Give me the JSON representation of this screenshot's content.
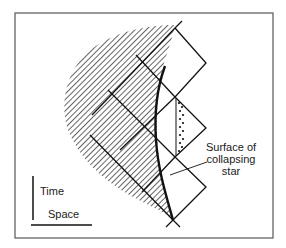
{
  "figure": {
    "frame": {
      "x": 15,
      "y": 13,
      "width": 258,
      "height": 225,
      "stroke": "#555555"
    },
    "colors": {
      "ink": "#111111",
      "hatch": "#222222",
      "background": "#ffffff"
    },
    "labels": {
      "surface": [
        "Surface of",
        "collapsing",
        "star"
      ],
      "time_axis": "Time",
      "space_axis": "Space"
    },
    "elements": {
      "star_interior": "hatched-region",
      "star_surface": "thick-curve-with-arrow",
      "light_cones": "null-diagonal-lines",
      "trapped_region": "dotted-column"
    }
  }
}
